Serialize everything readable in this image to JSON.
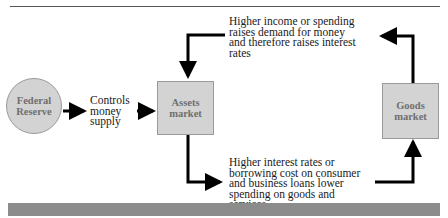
{
  "diagram": {
    "nodes": {
      "federal_reserve": {
        "line1": "Federal",
        "line2": "Reserve",
        "shape": "circle"
      },
      "assets_market": {
        "line1": "Assets",
        "line2": "market",
        "shape": "box"
      },
      "goods_market": {
        "line1": "Goods",
        "line2": "market",
        "shape": "box"
      }
    },
    "labels": {
      "controls": [
        "Controls",
        "money",
        "supply"
      ],
      "top_note": [
        "Higher income or spending",
        "raises demand for money",
        "and therefore raises interest",
        "rates"
      ],
      "bottom_note": [
        "Higher interest rates or",
        "borrowing cost on consumer",
        "and business loans lower",
        "spending on goods and",
        "services"
      ]
    },
    "edges": [
      {
        "from": "Federal Reserve",
        "to": "Assets market",
        "label": "Controls money supply"
      },
      {
        "from": "Assets market",
        "to": "Goods market",
        "label": "Higher interest rates or borrowing cost on consumer and business loans lower spending on goods and services"
      },
      {
        "from": "Goods market",
        "to": "Assets market",
        "label": "Higher income or spending raises demand for money and therefore raises interest rates"
      }
    ],
    "colors": {
      "node_fill": "#d3d3d3",
      "node_border": "#9a9a9a",
      "node_text": "#6f6f6f",
      "arrow": "#000000",
      "bottom_bar": "#8c8c8c"
    }
  }
}
